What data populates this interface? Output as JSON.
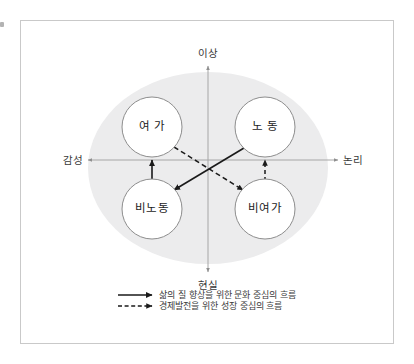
{
  "diagram": {
    "title_text": "",
    "background_color": "#ffffff",
    "frame_color": "#c9c9c9",
    "ellipse_color": "#ececed",
    "node_fill": "#ffffff",
    "node_border": "#8d8d8d",
    "axis_color": "#a6a6a6",
    "flow_color": "#1a1a1a",
    "axes": {
      "top_label": "이상",
      "bottom_label": "현실",
      "left_label": "감성",
      "right_label": "논리"
    },
    "nodes": [
      {
        "id": "leisure",
        "label": "여 가",
        "quadrant": "top-left",
        "cx": 152,
        "cy": 127,
        "r": 30
      },
      {
        "id": "labor",
        "label": "노 동",
        "quadrant": "top-right",
        "cx": 265,
        "cy": 127,
        "r": 30
      },
      {
        "id": "non-labor",
        "label": "비노동",
        "quadrant": "bottom-left",
        "cx": 152,
        "cy": 209,
        "r": 30
      },
      {
        "id": "non-leisure",
        "label": "비여가",
        "quadrant": "bottom-right",
        "cx": 265,
        "cy": 209,
        "r": 30
      }
    ],
    "flows": [
      {
        "id": "non-labor-to-leisure",
        "from": "비노동",
        "to": "여 가",
        "style": "solid"
      },
      {
        "id": "labor-to-non-labor",
        "from": "노 동",
        "to": "비노동",
        "style": "solid"
      },
      {
        "id": "non-leisure-to-labor",
        "from": "비여가",
        "to": "노 동",
        "style": "dashed"
      },
      {
        "id": "leisure-to-non-leisure",
        "from": "여 가",
        "to": "비여가",
        "style": "dashed"
      }
    ],
    "legend": [
      {
        "style": "solid",
        "label": "삶의 질 향상을 위한 문화 중심의 흐름"
      },
      {
        "style": "dashed",
        "label": "경제발전을 위한 성장 중심의 흐름"
      }
    ]
  }
}
